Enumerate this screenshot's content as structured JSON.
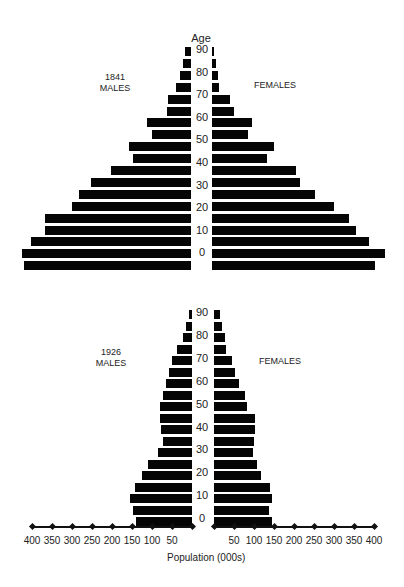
{
  "header": {
    "age_label": "Age"
  },
  "pyramid_1841": {
    "year": "1841",
    "males_label": "MALES",
    "females_label": "FEMALES"
  },
  "pyramid_1926": {
    "year": "1926",
    "males_label": "MALES",
    "females_label": "FEMALES"
  },
  "age_ticks": [
    "90",
    "80",
    "70",
    "60",
    "50",
    "40",
    "30",
    "20",
    "10",
    "0"
  ],
  "x_axis": {
    "label": "Population (000s)",
    "left_ticks": [
      "400",
      "350",
      "300",
      "250",
      "200",
      "150",
      "100",
      "50"
    ],
    "right_ticks": [
      "50",
      "100",
      "150",
      "200",
      "250",
      "300",
      "350",
      "400"
    ]
  },
  "chart_data": [
    {
      "type": "bar",
      "title": "1841",
      "subtype": "population-pyramid",
      "categories": [
        "90+",
        "85-89",
        "80-84",
        "75-79",
        "70-74",
        "65-69",
        "60-64",
        "55-59",
        "50-54",
        "45-49",
        "40-44",
        "35-39",
        "30-34",
        "25-29",
        "20-24",
        "15-19",
        "10-14",
        "5-9",
        "0-4"
      ],
      "series": [
        {
          "name": "MALES",
          "values": [
            15,
            20,
            28,
            38,
            58,
            60,
            110,
            98,
            155,
            145,
            200,
            250,
            280,
            298,
            365,
            365,
            400,
            423,
            418
          ]
        },
        {
          "name": "FEMALES",
          "values": [
            5,
            10,
            15,
            18,
            45,
            55,
            100,
            90,
            155,
            138,
            210,
            220,
            258,
            305,
            343,
            360,
            393,
            433,
            408
          ]
        }
      ],
      "ylabel": "Age",
      "xlabel": "Population (000s)",
      "xlim": [
        0,
        400
      ]
    },
    {
      "type": "bar",
      "title": "1926",
      "subtype": "population-pyramid",
      "categories": [
        "90+",
        "85-89",
        "80-84",
        "75-79",
        "70-74",
        "65-69",
        "60-64",
        "55-59",
        "50-54",
        "45-49",
        "40-44",
        "35-39",
        "30-34",
        "25-29",
        "20-24",
        "15-19",
        "10-14",
        "5-9",
        "0-4"
      ],
      "series": [
        {
          "name": "MALES",
          "values": [
            8,
            15,
            23,
            38,
            50,
            58,
            65,
            73,
            80,
            80,
            78,
            73,
            85,
            110,
            125,
            143,
            155,
            148,
            140
          ]
        },
        {
          "name": "FEMALES",
          "values": [
            15,
            20,
            28,
            30,
            45,
            53,
            63,
            78,
            83,
            103,
            103,
            100,
            98,
            108,
            118,
            140,
            145,
            138,
            145
          ]
        }
      ],
      "ylabel": "Age",
      "xlabel": "Population (000s)",
      "xlim": [
        0,
        400
      ]
    }
  ]
}
